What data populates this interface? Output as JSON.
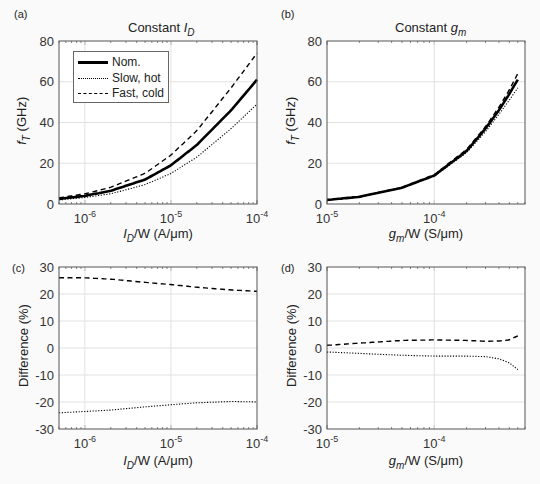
{
  "panels": {
    "a": {
      "label": "(a)",
      "title_prefix": "Constant ",
      "title_var": "I",
      "title_sub": "D"
    },
    "b": {
      "label": "(b)",
      "title_prefix": "Constant ",
      "title_var": "g",
      "title_sub": "m"
    },
    "c": {
      "label": "(c)"
    },
    "d": {
      "label": "(d)"
    }
  },
  "axes": {
    "ft_ylabel_var": "f",
    "ft_ylabel_sub": "T",
    "ft_ylabel_unit": "(GHz)",
    "diff_ylabel": "Difference (%)",
    "id_xlabel_var": "I",
    "id_xlabel_sub": "D",
    "id_xlabel_rest": "/W  (A/μm)",
    "gm_xlabel_var": "g",
    "gm_xlabel_sub": "m",
    "gm_xlabel_rest": "/W  (S/μm)"
  },
  "legend": {
    "nom": "Nom.",
    "slow": "Slow, hot",
    "fast": "Fast, cold"
  },
  "chart_data": [
    {
      "panel": "a",
      "type": "line",
      "title": "Constant I_D",
      "xlabel": "I_D/W (A/μm)",
      "ylabel": "f_T (GHz)",
      "xscale": "log",
      "xlim": [
        5e-07,
        0.0001
      ],
      "ylim": [
        0,
        80
      ],
      "grid": true,
      "legend_position": "upper left",
      "x": [
        5e-07,
        1e-06,
        2e-06,
        5e-06,
        1e-05,
        2e-05,
        5e-05,
        0.0001
      ],
      "series": [
        {
          "name": "Nom.",
          "values": [
            2.5,
            4,
            6.5,
            12,
            19,
            29,
            46,
            61
          ]
        },
        {
          "name": "Slow, hot",
          "values": [
            2,
            3.2,
            5,
            9.5,
            15,
            23,
            37,
            49
          ]
        },
        {
          "name": "Fast, cold",
          "values": [
            3,
            5,
            8.2,
            15,
            24,
            36,
            57,
            74
          ]
        }
      ]
    },
    {
      "panel": "b",
      "type": "line",
      "title": "Constant g_m",
      "xlabel": "g_m/W (S/μm)",
      "ylabel": "f_T (GHz)",
      "xscale": "log",
      "xlim": [
        1e-05,
        0.0007
      ],
      "ylim": [
        0,
        80
      ],
      "grid": true,
      "x": [
        1e-05,
        2e-05,
        5e-05,
        0.0001,
        0.0002,
        0.0003,
        0.0004,
        0.0005,
        0.0006
      ],
      "series": [
        {
          "name": "Nom.",
          "values": [
            2,
            3.5,
            8,
            14,
            26,
            37,
            46,
            54,
            61
          ]
        },
        {
          "name": "Slow, hot",
          "values": [
            2,
            3.4,
            7.8,
            13.6,
            25.2,
            35.5,
            44,
            51,
            57
          ]
        },
        {
          "name": "Fast, cold",
          "values": [
            2,
            3.5,
            8.2,
            14.4,
            26.8,
            38,
            47.5,
            56,
            64
          ]
        }
      ]
    },
    {
      "panel": "c",
      "type": "line",
      "xlabel": "I_D/W (A/μm)",
      "ylabel": "Difference (%)",
      "xscale": "log",
      "xlim": [
        5e-07,
        0.0001
      ],
      "ylim": [
        -30,
        30
      ],
      "grid": true,
      "x": [
        5e-07,
        1e-06,
        2e-06,
        5e-06,
        1e-05,
        2e-05,
        5e-05,
        0.0001
      ],
      "series": [
        {
          "name": "Slow, hot",
          "values": [
            -24,
            -23.5,
            -23,
            -21.8,
            -21,
            -20.3,
            -19.8,
            -20
          ]
        },
        {
          "name": "Fast, cold",
          "values": [
            26,
            26,
            25.5,
            24.3,
            23.5,
            22.5,
            21.5,
            21
          ]
        }
      ]
    },
    {
      "panel": "d",
      "type": "line",
      "xlabel": "g_m/W (S/μm)",
      "ylabel": "Difference (%)",
      "xscale": "log",
      "xlim": [
        1e-05,
        0.0007
      ],
      "ylim": [
        -30,
        30
      ],
      "grid": true,
      "x": [
        1e-05,
        2e-05,
        5e-05,
        0.0001,
        0.0002,
        0.0003,
        0.0004,
        0.0005,
        0.0006
      ],
      "series": [
        {
          "name": "Slow, hot",
          "values": [
            -1.5,
            -2,
            -2.7,
            -3,
            -3,
            -3.2,
            -4,
            -5.5,
            -8
          ]
        },
        {
          "name": "Fast, cold",
          "values": [
            1,
            1.8,
            2.8,
            3,
            2.8,
            2.5,
            2.6,
            3,
            4.5
          ]
        }
      ]
    }
  ]
}
